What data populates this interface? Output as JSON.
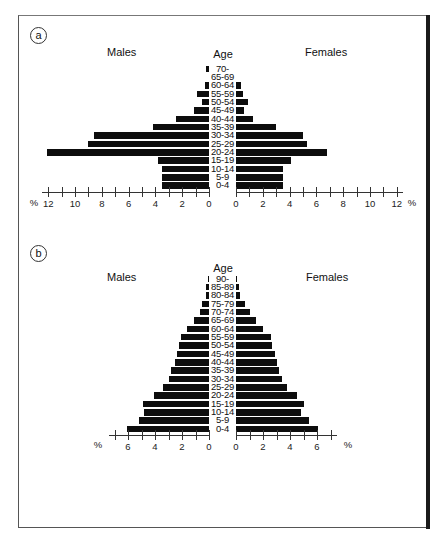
{
  "frame": {
    "present": true
  },
  "panels": [
    {
      "id": "a",
      "label": "a",
      "males_label": "Males",
      "females_label": "Females",
      "age_label": "Age",
      "unit": "%",
      "tick_labels": [
        "12",
        "10",
        "8",
        "6",
        "4",
        "2",
        "0"
      ]
    },
    {
      "id": "b",
      "label": "b",
      "males_label": "Males",
      "females_label": "Females",
      "age_label": "Age",
      "unit": "%",
      "tick_labels": [
        "6",
        "4",
        "2",
        "0"
      ]
    }
  ],
  "chart_data": [
    {
      "type": "bar",
      "subtype": "population-pyramid",
      "title": "a",
      "xlabel": "%",
      "ylabel": "Age",
      "xlim": [
        0,
        12
      ],
      "ticks": [
        0,
        2,
        4,
        6,
        8,
        10,
        12
      ],
      "minor_tick_interval": 1,
      "grid": false,
      "legend": [
        "Males",
        "Females"
      ],
      "categories": [
        "70-",
        "65-69",
        "60-64",
        "55-59",
        "50-54",
        "45-49",
        "40-44",
        "35-39",
        "30-34",
        "25-29",
        "20-24",
        "15-19",
        "10-14",
        "5-9",
        "0-4"
      ],
      "series": [
        {
          "name": "Males",
          "values": [
            0.2,
            0,
            0.3,
            0.9,
            0.5,
            1.1,
            2.5,
            4.2,
            8.6,
            9.0,
            12.1,
            3.8,
            3.5,
            3.5,
            3.5
          ]
        },
        {
          "name": "Females",
          "values": [
            0,
            0,
            0.4,
            0.5,
            0.9,
            0.6,
            1.3,
            3.0,
            5.0,
            5.3,
            6.8,
            4.1,
            3.5,
            3.5,
            3.5
          ]
        }
      ]
    },
    {
      "type": "bar",
      "subtype": "population-pyramid",
      "title": "b",
      "xlabel": "%",
      "ylabel": "Age",
      "xlim": [
        0,
        7
      ],
      "ticks": [
        0,
        2,
        4,
        6
      ],
      "minor_tick_interval": 1,
      "grid": false,
      "legend": [
        "Males",
        "Females"
      ],
      "categories": [
        "90-",
        "85-89",
        "80-84",
        "75-79",
        "70-74",
        "65-69",
        "60-64",
        "55-59",
        "50-54",
        "45-49",
        "40-44",
        "35-39",
        "30-34",
        "25-29",
        "20-24",
        "15-19",
        "10-14",
        "5-9",
        "0-4"
      ],
      "series": [
        {
          "name": "Males",
          "values": [
            0.1,
            0.2,
            0.2,
            0.5,
            0.7,
            1.1,
            1.6,
            2.1,
            2.2,
            2.4,
            2.5,
            2.8,
            3.0,
            3.4,
            4.1,
            4.9,
            4.8,
            5.2,
            6.1
          ]
        },
        {
          "name": "Females",
          "values": [
            0.1,
            0.2,
            0.3,
            0.7,
            1.0,
            1.5,
            2.0,
            2.6,
            2.7,
            2.9,
            3.0,
            3.2,
            3.4,
            3.8,
            4.5,
            5.0,
            4.8,
            5.4,
            6.1
          ]
        }
      ]
    }
  ]
}
